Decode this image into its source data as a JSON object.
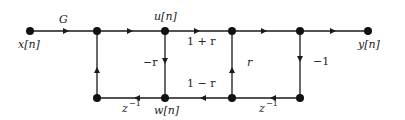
{
  "diagram": {
    "type": "signal-flow-graph",
    "nodes": [
      {
        "id": "x",
        "label": "x[n]",
        "x": 30,
        "y": 31
      },
      {
        "id": "a",
        "label": "",
        "x": 97,
        "y": 31
      },
      {
        "id": "u",
        "label": "u[n]",
        "x": 165,
        "y": 31
      },
      {
        "id": "b",
        "label": "",
        "x": 232,
        "y": 31
      },
      {
        "id": "c",
        "label": "",
        "x": 300,
        "y": 31
      },
      {
        "id": "y",
        "label": "y[n]",
        "x": 368,
        "y": 31
      },
      {
        "id": "a2",
        "label": "",
        "x": 97,
        "y": 98
      },
      {
        "id": "w",
        "label": "w[n]",
        "x": 165,
        "y": 98
      },
      {
        "id": "b2",
        "label": "",
        "x": 232,
        "y": 98
      },
      {
        "id": "c2",
        "label": "",
        "x": 300,
        "y": 98
      }
    ],
    "edges": [
      {
        "from": "x",
        "to": "a",
        "gain": "G"
      },
      {
        "from": "a",
        "to": "u",
        "gain": ""
      },
      {
        "from": "u",
        "to": "b",
        "gain": "1 + r"
      },
      {
        "from": "b",
        "to": "c",
        "gain": ""
      },
      {
        "from": "c",
        "to": "y",
        "gain": ""
      },
      {
        "from": "u",
        "to": "w",
        "gain": "−r"
      },
      {
        "from": "b2",
        "to": "b",
        "gain": "r"
      },
      {
        "from": "c",
        "to": "c2",
        "gain": "−1"
      },
      {
        "from": "a2",
        "to": "a",
        "gain": ""
      },
      {
        "from": "c2",
        "to": "b2",
        "gain": "z⁻¹"
      },
      {
        "from": "b2",
        "to": "w",
        "gain": "1 − r"
      },
      {
        "from": "w",
        "to": "a2",
        "gain": "z⁻¹"
      }
    ]
  },
  "labels": {
    "input": "x[n]",
    "output": "y[n]",
    "u": "u[n]",
    "w": "w[n]",
    "gain_G": "G",
    "gain_1pr": "1 + r",
    "gain_mr": "−r",
    "gain_r": "r",
    "gain_m1": "−1",
    "gain_1mr": "1 − r",
    "delay_left": "z",
    "delay_left_exp": "−1",
    "delay_right": "z",
    "delay_right_exp": "−1"
  }
}
